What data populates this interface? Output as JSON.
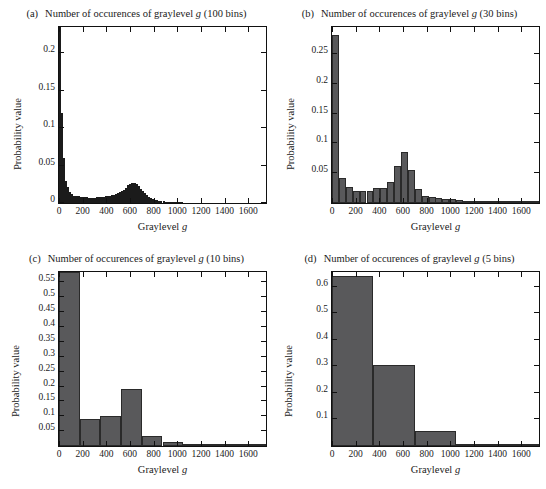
{
  "figure": {
    "xlabel": "Graylevel",
    "xlabel_italic": "g",
    "ylabel": "Probability value",
    "title_prefix": "Number of occurences of graylevel",
    "title_italic": "g",
    "bar_color": "#59595b",
    "bar_edge_color": "#2a2a2a",
    "panels": [
      {
        "tag": "(a)",
        "bins_label": "(100 bins)"
      },
      {
        "tag": "(b)",
        "bins_label": "(30 bins)"
      },
      {
        "tag": "(c)",
        "bins_label": "(10 bins)"
      },
      {
        "tag": "(d)",
        "bins_label": "(5 bins)"
      }
    ]
  },
  "chart_data": [
    {
      "type": "bar",
      "panel": "(a)",
      "title": "Number of occurences of graylevel g (100 bins)",
      "xlabel": "Graylevel g",
      "ylabel": "Probability value",
      "nbins": 100,
      "xlim": [
        0,
        1750
      ],
      "ylim": [
        0,
        0.235
      ],
      "xticks": [
        0,
        200,
        400,
        600,
        800,
        1000,
        1200,
        1400,
        1600
      ],
      "xticklabels": [
        "0",
        "200",
        "400",
        "600",
        "800",
        "1000",
        "1200",
        "1400",
        "1600"
      ],
      "yticks": [
        0,
        0.05,
        0.1,
        0.15,
        0.2
      ],
      "yticklabels": [
        "0",
        "0.05",
        "0.1",
        "0.15",
        "0.2"
      ],
      "grid": false,
      "legend": null,
      "note": "first bar is clipped at the top of the axes",
      "bin_width": 17.5,
      "x": [
        8.75,
        26.25,
        43.75,
        61.25,
        78.75,
        96.25,
        113.75,
        131.25,
        148.75,
        166.25,
        183.75,
        201.25,
        218.75,
        236.25,
        253.75,
        271.25,
        288.75,
        306.25,
        323.75,
        341.25,
        358.75,
        376.25,
        393.75,
        411.25,
        428.75,
        446.25,
        463.75,
        481.25,
        498.75,
        516.25,
        533.75,
        551.25,
        568.75,
        586.25,
        603.75,
        621.25,
        638.75,
        656.25,
        673.75,
        691.25,
        708.75,
        726.25,
        743.75,
        761.25,
        778.75,
        796.25,
        813.75,
        831.25,
        848.75,
        866.25,
        883.75,
        901.25,
        918.75,
        936.25,
        953.75,
        971.25,
        988.75,
        1006.25,
        1023.75,
        1041.25,
        1058.75,
        1076.25,
        1093.75,
        1111.25,
        1128.75,
        1146.25,
        1163.75,
        1181.25,
        1198.75,
        1216.25,
        1233.75,
        1251.25,
        1268.75,
        1286.25,
        1303.75,
        1321.25,
        1338.75,
        1356.25,
        1373.75,
        1391.25,
        1408.75,
        1426.25,
        1443.75,
        1461.25,
        1478.75,
        1496.25,
        1513.75,
        1531.25,
        1548.75,
        1566.25,
        1583.75,
        1601.25,
        1618.75,
        1636.25,
        1653.75,
        1671.25,
        1688.75,
        1706.25,
        1723.75,
        1741.25
      ],
      "values": [
        0.262,
        0.12,
        0.06,
        0.03,
        0.021,
        0.015,
        0.012,
        0.01,
        0.0095,
        0.009,
        0.0085,
        0.008,
        0.0078,
        0.0075,
        0.0072,
        0.007,
        0.007,
        0.0072,
        0.0075,
        0.0078,
        0.0082,
        0.0086,
        0.009,
        0.0095,
        0.01,
        0.0105,
        0.0112,
        0.012,
        0.013,
        0.0142,
        0.0158,
        0.018,
        0.0205,
        0.0235,
        0.0258,
        0.027,
        0.0268,
        0.0252,
        0.0225,
        0.0192,
        0.0158,
        0.0128,
        0.0102,
        0.0082,
        0.0066,
        0.0054,
        0.0045,
        0.0038,
        0.0032,
        0.0027,
        0.0023,
        0.002,
        0.0017,
        0.0015,
        0.0013,
        0.0011,
        0.001,
        0.0009,
        0.0008,
        0.0007,
        0.00065,
        0.0006,
        0.00055,
        0.0005,
        0.00046,
        0.00042,
        0.00038,
        0.00035,
        0.00032,
        0.0003,
        0.00028,
        0.00026,
        0.00024,
        0.00022,
        0.0002,
        0.00019,
        0.00018,
        0.00017,
        0.00016,
        0.00015,
        0.00014,
        0.00013,
        0.00012,
        0.00011,
        0.0001,
        9e-05,
        8e-05,
        8e-05,
        7e-05,
        7e-05,
        6e-05,
        6e-05,
        5e-05,
        5e-05,
        4e-05,
        4e-05,
        3e-05,
        3e-05,
        2e-05,
        2e-05
      ]
    },
    {
      "type": "bar",
      "panel": "(b)",
      "title": "Number of occurences of graylevel g (30 bins)",
      "xlabel": "Graylevel g",
      "ylabel": "Probability value",
      "nbins": 30,
      "xlim": [
        0,
        1750
      ],
      "ylim": [
        0,
        0.295
      ],
      "xticks": [
        0,
        200,
        400,
        600,
        800,
        1000,
        1200,
        1400,
        1600
      ],
      "xticklabels": [
        "0",
        "200",
        "400",
        "600",
        "800",
        "1000",
        "1200",
        "1400",
        "1600"
      ],
      "yticks": [
        0.05,
        0.1,
        0.15,
        0.2,
        0.25
      ],
      "yticklabels": [
        "0.05",
        "0.1",
        "0.15",
        "0.2",
        "0.25"
      ],
      "grid": false,
      "legend": null,
      "bin_width": 58.33,
      "x": [
        29,
        87,
        146,
        204,
        262,
        321,
        379,
        437,
        496,
        554,
        612,
        671,
        729,
        787,
        846,
        904,
        962,
        1021,
        1079,
        1137,
        1196,
        1254,
        1312,
        1371,
        1429,
        1487,
        1546,
        1604,
        1662,
        1721
      ],
      "values": [
        0.281,
        0.042,
        0.027,
        0.02,
        0.02,
        0.02,
        0.025,
        0.026,
        0.036,
        0.062,
        0.085,
        0.056,
        0.023,
        0.012,
        0.01,
        0.009,
        0.0075,
        0.006,
        0.0048,
        0.004,
        0.0032,
        0.0026,
        0.0021,
        0.0017,
        0.0014,
        0.0011,
        0.0009,
        0.0007,
        0.0005,
        0.0004
      ]
    },
    {
      "type": "bar",
      "panel": "(c)",
      "title": "Number of occurences of graylevel g (10 bins)",
      "xlabel": "Graylevel g",
      "ylabel": "Probability value",
      "nbins": 10,
      "xlim": [
        0,
        1750
      ],
      "ylim": [
        0,
        0.585
      ],
      "xticks": [
        0,
        200,
        400,
        600,
        800,
        1000,
        1200,
        1400,
        1600
      ],
      "xticklabels": [
        "0",
        "200",
        "400",
        "600",
        "800",
        "1000",
        "1200",
        "1400",
        "1600"
      ],
      "yticks": [
        0.05,
        0.1,
        0.15,
        0.2,
        0.25,
        0.3,
        0.35,
        0.4,
        0.45,
        0.5,
        0.55
      ],
      "yticklabels": [
        "0.05",
        "0.1",
        "0.15",
        "0.2",
        "0.25",
        "0.3",
        "0.35",
        "0.4",
        "0.45",
        "0.5",
        "0.55"
      ],
      "grid": false,
      "legend": null,
      "note": "first bar is clipped at the top of the axes",
      "bin_width": 175,
      "x": [
        87.5,
        262.5,
        437.5,
        612.5,
        787.5,
        962.5,
        1137.5,
        1312.5,
        1487.5,
        1662.5
      ],
      "values": [
        0.585,
        0.09,
        0.102,
        0.192,
        0.034,
        0.014,
        0.0055,
        0.003,
        0.0012,
        0.0006
      ]
    },
    {
      "type": "bar",
      "panel": "(d)",
      "title": "Number of occurences of graylevel g (5 bins)",
      "xlabel": "Graylevel g",
      "ylabel": "Probability value",
      "nbins": 5,
      "xlim": [
        0,
        1750
      ],
      "ylim": [
        0,
        0.655
      ],
      "xticks": [
        0,
        200,
        400,
        600,
        800,
        1000,
        1200,
        1400,
        1600
      ],
      "xticklabels": [
        "0",
        "200",
        "400",
        "600",
        "800",
        "1000",
        "1200",
        "1400",
        "1600"
      ],
      "yticks": [
        0.1,
        0.2,
        0.3,
        0.4,
        0.5,
        0.6
      ],
      "yticklabels": [
        "0.1",
        "0.2",
        "0.3",
        "0.4",
        "0.5",
        "0.6"
      ],
      "grid": false,
      "legend": null,
      "bin_width": 350,
      "x": [
        175,
        525,
        875,
        1225,
        1575
      ],
      "values": [
        0.64,
        0.305,
        0.055,
        0.0055,
        0.0008
      ]
    }
  ]
}
